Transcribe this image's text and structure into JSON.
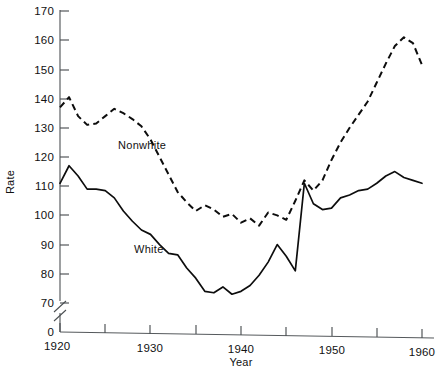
{
  "chart_data": {
    "type": "line",
    "title": "",
    "xlabel": "Year",
    "ylabel": "Rate",
    "xlim": [
      1920,
      1961
    ],
    "ylim": [
      65,
      172
    ],
    "grid": false,
    "legend_position": "inline-annotation",
    "axis_break": true,
    "y_axis_starts_at_zero_label": true,
    "x_ticks_major": [
      1920,
      1930,
      1940,
      1950,
      1960
    ],
    "x_ticks_minor": [
      1925,
      1935,
      1945,
      1955
    ],
    "y_ticks": [
      70,
      80,
      90,
      100,
      110,
      120,
      130,
      140,
      150,
      160,
      170
    ],
    "y_zero_label": "0",
    "series": [
      {
        "name": "Nonwhite",
        "style": "dashed",
        "label_x": 1930,
        "label_y": 124,
        "x": [
          1920,
          1921,
          1922,
          1923,
          1924,
          1925,
          1926,
          1927,
          1928,
          1929,
          1930,
          1931,
          1932,
          1933,
          1934,
          1935,
          1936,
          1937,
          1938,
          1939,
          1940,
          1941,
          1942,
          1943,
          1944,
          1945,
          1946,
          1947,
          1948,
          1949,
          1950,
          1951,
          1952,
          1953,
          1954,
          1955,
          1956,
          1957,
          1958,
          1959,
          1960
        ],
        "values": [
          137,
          140.5,
          134,
          131,
          131.5,
          134,
          136.5,
          135,
          133,
          130.5,
          126,
          120,
          114,
          108,
          104.5,
          101.5,
          103.5,
          102,
          99.5,
          100.5,
          97.5,
          99,
          96.5,
          101,
          100,
          98.5,
          105,
          112,
          108.5,
          112,
          119,
          125,
          130,
          134.5,
          139,
          145.5,
          152,
          158,
          161,
          159,
          151.5
        ]
      },
      {
        "name": "White",
        "style": "solid",
        "label_x": 1931,
        "label_y": 90,
        "x": [
          1920,
          1921,
          1922,
          1923,
          1924,
          1925,
          1926,
          1927,
          1928,
          1929,
          1930,
          1931,
          1932,
          1933,
          1934,
          1935,
          1936,
          1937,
          1938,
          1939,
          1940,
          1941,
          1942,
          1943,
          1944,
          1945,
          1946,
          1947,
          1948,
          1949,
          1950,
          1951,
          1952,
          1953,
          1954,
          1955,
          1956,
          1957,
          1958,
          1959,
          1960
        ],
        "values": [
          111,
          117,
          113.5,
          109,
          109,
          108.5,
          106,
          101.5,
          98,
          95,
          93.5,
          90,
          87,
          86.5,
          82,
          78.5,
          74,
          73.5,
          75.5,
          73,
          74,
          76,
          79.5,
          84,
          90,
          86,
          81,
          111,
          104,
          102,
          102.5,
          106,
          107,
          108.5,
          109,
          111,
          113.5,
          115,
          113,
          112,
          111
        ]
      }
    ]
  },
  "axis": {
    "y_title": "Rate",
    "x_title": "Year"
  },
  "caption": {
    "text": ""
  }
}
